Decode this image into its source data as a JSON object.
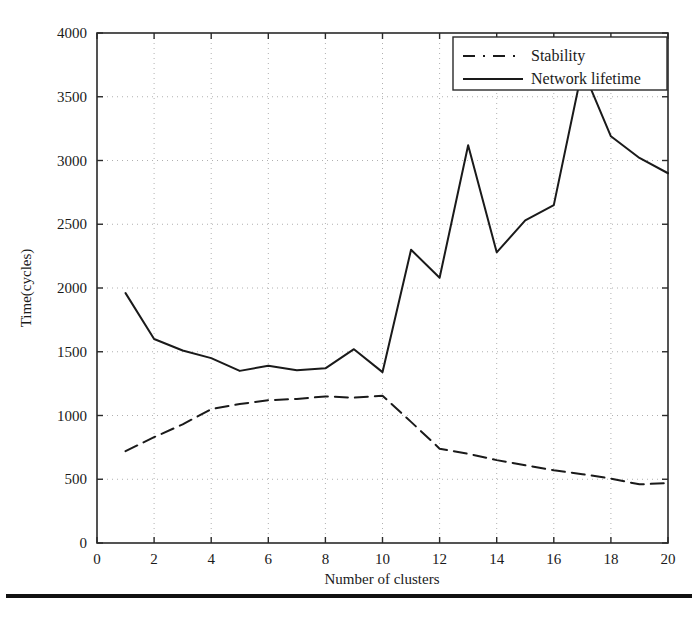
{
  "chart_data": {
    "type": "line",
    "title": "",
    "xlabel": "Number of clusters",
    "ylabel": "Time(cycles)",
    "xlim": [
      0,
      20
    ],
    "ylim": [
      0,
      4000
    ],
    "xticks": [
      0,
      2,
      4,
      6,
      8,
      10,
      12,
      14,
      16,
      18,
      20
    ],
    "xtick_labels": [
      "0",
      "2",
      "4",
      "6",
      "8",
      "10",
      "12",
      "14",
      "16",
      "18",
      "20"
    ],
    "yticks": [
      0,
      500,
      1000,
      1500,
      2000,
      2500,
      3000,
      3500,
      4000
    ],
    "ytick_labels": [
      "0",
      "500",
      "1000",
      "1500",
      "2000",
      "2500",
      "3000",
      "3500",
      "4000"
    ],
    "grid": true,
    "grid_style": "dotted",
    "grid_color": "#b0b0b0",
    "legend_position": "upper right",
    "x": [
      1,
      2,
      3,
      4,
      5,
      6,
      7,
      8,
      9,
      10,
      11,
      12,
      13,
      14,
      15,
      16,
      17,
      18,
      19,
      20
    ],
    "series": [
      {
        "name": "Stability",
        "style": "dashed",
        "color": "#1a1a1a",
        "values": [
          720,
          830,
          930,
          1050,
          1090,
          1120,
          1130,
          1150,
          1140,
          1155,
          950,
          740,
          700,
          650,
          610,
          570,
          540,
          505,
          460,
          470
        ]
      },
      {
        "name": "Network lifetime",
        "style": "solid",
        "color": "#1a1a1a",
        "values": [
          1960,
          1600,
          1510,
          1450,
          1350,
          1390,
          1355,
          1370,
          1520,
          1340,
          2300,
          2080,
          3120,
          2280,
          2530,
          2650,
          3720,
          3190,
          3020,
          2900
        ]
      }
    ]
  },
  "legend": {
    "items": [
      {
        "label": "Stability",
        "style": "dashed"
      },
      {
        "label": "Network lifetime",
        "style": "solid"
      }
    ]
  },
  "footer": {
    "caption_fragment": ""
  }
}
